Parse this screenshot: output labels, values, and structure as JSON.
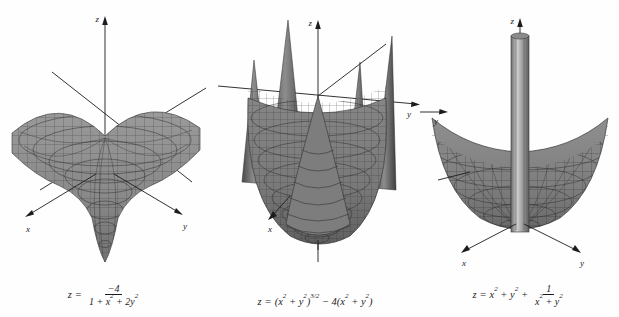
{
  "figure": {
    "background_color": "#fefefe",
    "ink_color": "#1c1c1c",
    "surface_fill": "#8f8f8f",
    "surface_fill_dark": "#6e6e6e",
    "mesh_line_color": "#3a3a3a",
    "panel_count": 3
  },
  "panels": [
    {
      "id": "panel-1",
      "plot_type": "3d-surface-mesh",
      "surface_shape": "downward-funnel-well",
      "axes": {
        "z_label": "z",
        "x_label": "x",
        "y_label": "y",
        "z_direction": "up",
        "x_direction": "lower-left",
        "y_direction": "lower-right"
      },
      "equation": {
        "lhs": "z",
        "equals": "=",
        "numerator": "−4",
        "denominator_parts": [
          {
            "text": "1 + "
          },
          {
            "base": "x",
            "exp": "2"
          },
          {
            "text": " + 2"
          },
          {
            "base": "y",
            "exp": "2"
          }
        ],
        "plain": "z = -4 / (1 + x^2 + 2y^2)"
      }
    },
    {
      "id": "panel-2",
      "plot_type": "3d-surface-mesh",
      "surface_shape": "bowl-with-four-upward-spikes",
      "axes": {
        "z_label": "z",
        "x_label": "x",
        "y_label": "y",
        "z_direction": "up",
        "x_direction": "lower-left",
        "y_direction": "right"
      },
      "equation": {
        "lhs": "z",
        "equals": "=",
        "parts": [
          {
            "text": "("
          },
          {
            "base": "x",
            "exp": "2"
          },
          {
            "text": " + "
          },
          {
            "base": "y",
            "exp": "2"
          },
          {
            "text": ")"
          },
          {
            "sup": "3/2"
          },
          {
            "text": " − 4("
          },
          {
            "base": "x",
            "exp": "2"
          },
          {
            "text": " + "
          },
          {
            "base": "y",
            "exp": "2"
          },
          {
            "text": ")"
          }
        ],
        "plain": "z = (x^2 + y^2)^(3/2) - 4(x^2 + y^2)"
      }
    },
    {
      "id": "panel-3",
      "plot_type": "3d-surface-mesh",
      "surface_shape": "paraboloid-bowl-with-central-vertical-spike",
      "axes": {
        "z_label": "z",
        "x_label": "x",
        "y_label": "y",
        "z_direction": "up",
        "x_direction": "lower-left",
        "y_direction": "lower-right"
      },
      "equation": {
        "lhs": "z",
        "equals": "=",
        "lead_parts": [
          {
            "base": "x",
            "exp": "2"
          },
          {
            "text": " + "
          },
          {
            "base": "y",
            "exp": "2"
          },
          {
            "text": " + "
          }
        ],
        "numerator": "1",
        "denominator_parts": [
          {
            "base": "x",
            "exp": "2"
          },
          {
            "text": " + "
          },
          {
            "base": "y",
            "exp": "2"
          }
        ],
        "plain": "z = x^2 + y^2 + 1/(x^2 + y^2)"
      }
    }
  ]
}
